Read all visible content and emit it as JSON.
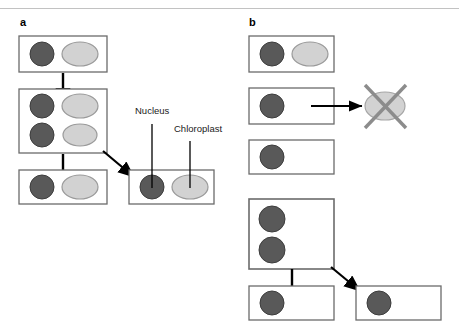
{
  "figure": {
    "background_color": "#ffffff",
    "width": 459,
    "height": 330,
    "top_rule_color": "#b8b8b8"
  },
  "colors": {
    "nucleus_fill": "#595959",
    "nucleus_stroke": "#3d3d3d",
    "chloroplast_fill": "#d2d2d2",
    "chloroplast_stroke": "#9a9a9a",
    "cell_stroke": "#6b6b6b",
    "cell_fill": "#ffffff",
    "arrow_color": "#000000",
    "cross_color": "#8c8c8c",
    "leader_color": "#000000",
    "text_color": "#1a1a1a"
  },
  "panels": [
    {
      "id": "a",
      "letter": "a",
      "caption_hint": "organelle inheritance retained through division"
    },
    {
      "id": "b",
      "letter": "b",
      "caption_hint": "organelle lost during division"
    }
  ],
  "labels": {
    "nucleus": "Nucleus",
    "chloroplast": "Chloroplast"
  },
  "icons": {
    "nucleus": "nucleus-circle-icon",
    "chloroplast": "chloroplast-ellipse-icon",
    "cross": "cross-out-icon",
    "arrow_down": "arrow-down-icon",
    "arrow_right": "arrow-right-icon",
    "arrow_diagonal": "arrow-diagonal-icon",
    "leader_line": "leader-line-icon"
  },
  "diagram_data": {
    "type": "diagram",
    "subject": "Cell division and organelle inheritance",
    "panel_a": {
      "cells": [
        {
          "name": "cell-a1",
          "x": 19,
          "y": 36,
          "w": 88,
          "h": 36,
          "nuclei": [
            {
              "cx": 42,
              "cy": 54,
              "r": 12
            }
          ],
          "chloroplasts": [
            {
              "cx": 80,
              "cy": 54,
              "rx": 18,
              "ry": 12
            }
          ]
        },
        {
          "name": "cell-a2",
          "x": 19,
          "y": 89,
          "w": 88,
          "h": 64,
          "nuclei": [
            {
              "cx": 42,
              "cy": 106,
              "r": 12
            },
            {
              "cx": 42,
              "cy": 135,
              "r": 12
            }
          ],
          "chloroplasts": [
            {
              "cx": 80,
              "cy": 106,
              "rx": 18,
              "ry": 12
            },
            {
              "cx": 80,
              "cy": 135,
              "rx": 17,
              "ry": 11
            }
          ]
        },
        {
          "name": "cell-a3",
          "x": 19,
          "y": 170,
          "w": 88,
          "h": 34,
          "nuclei": [
            {
              "cx": 42,
              "cy": 187,
              "r": 12
            }
          ],
          "chloroplasts": [
            {
              "cx": 80,
              "cy": 187,
              "rx": 18,
              "ry": 12
            }
          ]
        },
        {
          "name": "cell-a-labeled",
          "x": 129,
          "y": 170,
          "w": 85,
          "h": 34,
          "nuclei": [
            {
              "cx": 152,
              "cy": 187,
              "r": 12
            }
          ],
          "chloroplasts": [
            {
              "cx": 190,
              "cy": 187,
              "rx": 18,
              "ry": 12
            }
          ]
        }
      ],
      "arrows": [
        {
          "name": "arrow-a1-to-a2",
          "kind": "down",
          "x1": 63,
          "y1": 73,
          "x2": 63,
          "y2": 104
        },
        {
          "name": "arrow-a2-to-a3",
          "kind": "down",
          "x1": 63,
          "y1": 154,
          "x2": 63,
          "y2": 186
        },
        {
          "name": "arrow-a2-to-labeled",
          "kind": "diagonal",
          "x1": 104,
          "y1": 152,
          "x2": 133,
          "y2": 176
        }
      ],
      "leaders": [
        {
          "name": "leader-nucleus",
          "x1": 152,
          "y1": 124,
          "x2": 152,
          "y2": 188
        },
        {
          "name": "leader-chloroplast",
          "x1": 190,
          "y1": 140,
          "x2": 190,
          "y2": 188
        }
      ]
    },
    "panel_b": {
      "cells": [
        {
          "name": "cell-b1",
          "x": 249,
          "y": 36,
          "w": 85,
          "h": 36,
          "nuclei": [
            {
              "cx": 272,
              "cy": 54,
              "r": 12
            }
          ],
          "chloroplasts": [
            {
              "cx": 310,
              "cy": 54,
              "rx": 18,
              "ry": 12
            }
          ]
        },
        {
          "name": "cell-b2",
          "x": 249,
          "y": 88,
          "w": 85,
          "h": 36,
          "nuclei": [
            {
              "cx": 272,
              "cy": 106,
              "r": 12
            }
          ],
          "chloroplasts": []
        },
        {
          "name": "cell-b3",
          "x": 249,
          "y": 140,
          "w": 85,
          "h": 34,
          "nuclei": [
            {
              "cx": 272,
              "cy": 157,
              "r": 12
            }
          ],
          "chloroplasts": []
        },
        {
          "name": "cell-b4",
          "x": 249,
          "y": 199,
          "w": 85,
          "h": 70,
          "nuclei": [
            {
              "cx": 272,
              "cy": 219,
              "r": 13
            },
            {
              "cx": 272,
              "cy": 250,
              "r": 13
            }
          ],
          "chloroplasts": []
        },
        {
          "name": "cell-b5",
          "x": 249,
          "y": 286,
          "w": 85,
          "h": 34,
          "nuclei": [
            {
              "cx": 272,
              "cy": 303,
              "r": 12
            }
          ],
          "chloroplasts": []
        },
        {
          "name": "cell-b6",
          "x": 356,
          "y": 286,
          "w": 85,
          "h": 34,
          "nuclei": [
            {
              "cx": 379,
              "cy": 303,
              "r": 12
            }
          ],
          "chloroplasts": []
        }
      ],
      "discarded_chloroplast": {
        "name": "discarded-chloroplast",
        "cx": 385,
        "cy": 106,
        "rx": 20,
        "ry": 14,
        "crossed_out": true
      },
      "arrows": [
        {
          "name": "arrow-b2-to-discarded",
          "kind": "right",
          "x1": 313,
          "y1": 106,
          "x2": 361,
          "y2": 106
        },
        {
          "name": "arrow-b4-to-b5",
          "kind": "down",
          "x1": 292,
          "y1": 269,
          "x2": 292,
          "y2": 302
        },
        {
          "name": "arrow-b4-to-b6",
          "kind": "diagonal",
          "x1": 332,
          "y1": 268,
          "x2": 360,
          "y2": 290
        }
      ]
    }
  }
}
